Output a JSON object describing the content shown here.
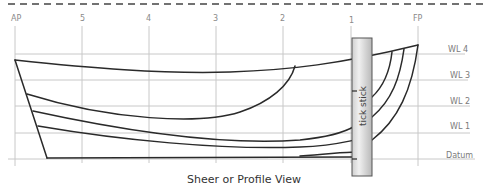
{
  "caption": "Sheer or Profile View",
  "stations": [
    {
      "label": "AP",
      "x": 15
    },
    {
      "label": "5",
      "x": 82
    },
    {
      "label": "4",
      "x": 149
    },
    {
      "label": "3",
      "x": 216
    },
    {
      "label": "2",
      "x": 283
    },
    {
      "label": "1",
      "x": 351
    },
    {
      "label": "FP",
      "x": 418
    }
  ],
  "waterlines": [
    {
      "label": "WL 4",
      "y": 54
    },
    {
      "label": "WL 3",
      "y": 80
    },
    {
      "label": "WL 2",
      "y": 106
    },
    {
      "label": "WL 1",
      "y": 133
    },
    {
      "label": "Datum",
      "y": 159
    }
  ],
  "tick_stick": {
    "label": "tick stick"
  },
  "colors": {
    "grid": "#c8c8c8",
    "hull_line": "#2a2a2a",
    "dashed_border": "#444444",
    "stick_fill_light": "#eeeeee",
    "stick_fill_dark": "#bdbdbd",
    "stick_border": "#555555"
  }
}
